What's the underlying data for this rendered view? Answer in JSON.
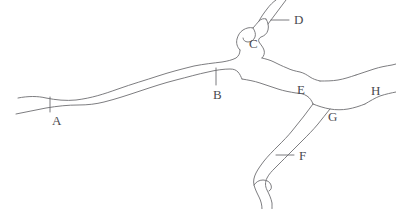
{
  "figure": {
    "type": "river-network-line-diagram",
    "background_color": "#ffffff",
    "stroke_color": "#6e6e72",
    "label_color": "#4a4a50",
    "width": 396,
    "height": 209
  },
  "labels": [
    {
      "id": "A",
      "text": "A",
      "x": 52,
      "y": 114,
      "description": "main-channel-lower-left-reach"
    },
    {
      "id": "B",
      "text": "B",
      "x": 213,
      "y": 88,
      "description": "main-channel-mid-reach"
    },
    {
      "id": "C",
      "text": "C",
      "x": 249,
      "y": 37,
      "description": "upper-pool-widening"
    },
    {
      "id": "D",
      "text": "D",
      "x": 294,
      "y": 18,
      "description": "northern-tributary"
    },
    {
      "id": "E",
      "text": "E",
      "x": 297,
      "y": 83,
      "description": "eastern-branch-confluence"
    },
    {
      "id": "F",
      "text": "F",
      "x": 299,
      "y": 157,
      "description": "southern-tributary"
    },
    {
      "id": "G",
      "text": "G",
      "x": 328,
      "y": 110,
      "description": "lower-junction-pool"
    },
    {
      "id": "H",
      "text": "H",
      "x": 371,
      "y": 91,
      "description": "eastern-outlet-reach"
    }
  ],
  "leaders": [
    {
      "for": "A",
      "kind": "tick-vertical",
      "from": [
        50,
        97
      ],
      "to": [
        50,
        112
      ]
    },
    {
      "for": "B",
      "kind": "tick-vertical",
      "from": [
        216,
        68
      ],
      "to": [
        216,
        85
      ]
    },
    {
      "for": "D",
      "kind": "leader-horizontal",
      "from": [
        271,
        20
      ],
      "to": [
        289,
        20
      ]
    },
    {
      "for": "F",
      "kind": "leader-horizontal",
      "from": [
        276,
        155
      ],
      "to": [
        294,
        155
      ]
    }
  ],
  "channels": [
    {
      "name": "main-channel-north-bank",
      "description": "upper bank from west edge to C pool"
    },
    {
      "name": "main-channel-south-bank",
      "description": "lower bank from west edge to E junction"
    },
    {
      "name": "pool-c-outline",
      "description": "widened pool at label C"
    },
    {
      "name": "tributary-d",
      "description": "north-east tributary exiting top edge"
    },
    {
      "name": "branch-e-north",
      "description": "east branch north bank from C toward G"
    },
    {
      "name": "branch-e-south",
      "description": "east branch south bank from B junction toward G"
    },
    {
      "name": "pool-g-outline",
      "description": "junction widening at label G"
    },
    {
      "name": "outlet-h-north",
      "description": "north bank of east outlet exiting right edge"
    },
    {
      "name": "outlet-h-south",
      "description": "south bank of east outlet exiting right edge"
    },
    {
      "name": "tributary-f-west",
      "description": "west bank of south tributary"
    },
    {
      "name": "tributary-f-east",
      "description": "east bank of south tributary"
    }
  ]
}
